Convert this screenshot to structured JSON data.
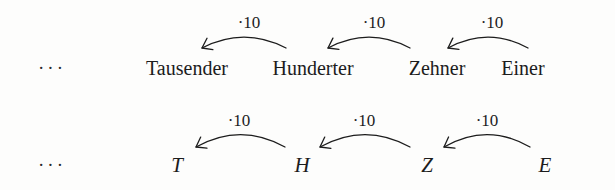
{
  "figure": {
    "background_color": "#fdfdfc",
    "ink_color": "#1c1c1c",
    "rows": [
      {
        "id": "row-words",
        "baseline_y": 68,
        "leading_ellipsis": "···",
        "ellipsis_x": 52,
        "nodes": [
          {
            "label": "Tausender",
            "x": 187
          },
          {
            "label": "Hunderter",
            "x": 313
          },
          {
            "label": "Zehner",
            "x": 437
          },
          {
            "label": "Einer",
            "x": 523
          }
        ],
        "arrows": [
          {
            "label": "·10",
            "label_x": 249,
            "label_y": 22,
            "from_x": 286,
            "to_x": 202,
            "base_y": 48,
            "apex_y": 34
          },
          {
            "label": "·10",
            "label_x": 374,
            "label_y": 22,
            "from_x": 410,
            "to_x": 328,
            "base_y": 48,
            "apex_y": 34
          },
          {
            "label": "·10",
            "label_x": 492,
            "label_y": 22,
            "from_x": 528,
            "to_x": 448,
            "base_y": 48,
            "apex_y": 34
          }
        ]
      },
      {
        "id": "row-symbols",
        "baseline_y": 165,
        "leading_ellipsis": "···",
        "ellipsis_x": 52,
        "nodes": [
          {
            "label": "T",
            "x": 177
          },
          {
            "label": "H",
            "x": 302
          },
          {
            "label": "Z",
            "x": 427
          },
          {
            "label": "E",
            "x": 545
          }
        ],
        "arrows": [
          {
            "label": "·10",
            "label_x": 239,
            "label_y": 120,
            "from_x": 285,
            "to_x": 196,
            "base_y": 147,
            "apex_y": 131
          },
          {
            "label": "·10",
            "label_x": 364,
            "label_y": 120,
            "from_x": 410,
            "to_x": 320,
            "base_y": 147,
            "apex_y": 131
          },
          {
            "label": "·10",
            "label_x": 487,
            "label_y": 120,
            "from_x": 530,
            "to_x": 444,
            "base_y": 147,
            "apex_y": 131
          }
        ]
      }
    ]
  }
}
